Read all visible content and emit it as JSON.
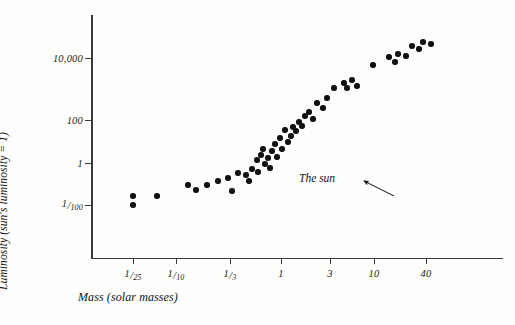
{
  "figure": {
    "kind": "scatter-plot",
    "background_color": "#fdfdfb",
    "ink_color": "#111110"
  },
  "axes": {
    "y_title": "Luminosity (sun's luminosity = 1)",
    "x_title": "Mass (solar masses)",
    "y_ticks": [
      {
        "label": "10,000",
        "num": "",
        "slash": "",
        "den": "",
        "py": 58
      },
      {
        "label": "100",
        "num": "",
        "slash": "",
        "den": "",
        "py": 120
      },
      {
        "label": "1",
        "num": "",
        "slash": "",
        "den": "",
        "py": 163
      },
      {
        "label": "",
        "num": "1",
        "slash": "/",
        "den": "100",
        "py": 205
      }
    ],
    "x_ticks": [
      {
        "label": "",
        "num": "1",
        "slash": "/",
        "den": "25",
        "px": 133
      },
      {
        "label": "",
        "num": "1",
        "slash": "/",
        "den": "10",
        "px": 176
      },
      {
        "label": "",
        "num": "1",
        "slash": "/",
        "den": "3",
        "px": 230
      },
      {
        "label": "1",
        "num": "",
        "slash": "",
        "den": "",
        "px": 281
      },
      {
        "label": "3",
        "num": "",
        "slash": "",
        "den": "",
        "px": 330
      },
      {
        "label": "10",
        "num": "",
        "slash": "",
        "den": "",
        "px": 374
      },
      {
        "label": "40",
        "num": "",
        "slash": "",
        "den": "",
        "px": 426
      }
    ]
  },
  "annotation": {
    "text": "The sun",
    "arrow_from_px": 304,
    "arrow_from_py": 180,
    "arrow_to_px": 272,
    "arrow_to_py": 166
  },
  "chart_data": {
    "type": "scatter",
    "title": "",
    "xlabel": "Mass (solar masses)",
    "ylabel": "Luminosity (sun's luminosity = 1)",
    "xscale": "log",
    "yscale": "log",
    "xtick_values": [
      0.04,
      0.1,
      0.333,
      1,
      3,
      10,
      40
    ],
    "xtick_labels": [
      "1/25",
      "1/10",
      "1/3",
      "1",
      "3",
      "10",
      "40"
    ],
    "ytick_values": [
      10000,
      100,
      1,
      0.01
    ],
    "ytick_labels": [
      "10,000",
      "100",
      "1",
      "1/100"
    ],
    "xlim": [
      0.028,
      60
    ],
    "ylim": [
      0.0015,
      60000
    ],
    "grid": false,
    "legend": false,
    "annotations": [
      {
        "text": "The sun",
        "x": 1.0,
        "y": 1.0
      }
    ],
    "points": [
      {
        "px": 133,
        "py": 196,
        "x": 0.04,
        "y": 0.02
      },
      {
        "px": 133,
        "py": 205,
        "x": 0.04,
        "y": 0.01
      },
      {
        "px": 157,
        "py": 196,
        "x": 0.062,
        "y": 0.02
      },
      {
        "px": 188,
        "py": 185,
        "x": 0.13,
        "y": 0.045
      },
      {
        "px": 196,
        "py": 190,
        "x": 0.155,
        "y": 0.03
      },
      {
        "px": 207,
        "py": 185,
        "x": 0.19,
        "y": 0.045
      },
      {
        "px": 218,
        "py": 181,
        "x": 0.24,
        "y": 0.065
      },
      {
        "px": 228,
        "py": 178,
        "x": 0.3,
        "y": 0.085
      },
      {
        "px": 232,
        "py": 191,
        "x": 0.33,
        "y": 0.028
      },
      {
        "px": 238,
        "py": 173,
        "x": 0.38,
        "y": 0.13
      },
      {
        "px": 246,
        "py": 175,
        "x": 0.47,
        "y": 0.11
      },
      {
        "px": 249,
        "py": 181,
        "x": 0.5,
        "y": 0.065
      },
      {
        "px": 252,
        "py": 169,
        "x": 0.55,
        "y": 0.17
      },
      {
        "px": 257,
        "py": 160,
        "x": 0.62,
        "y": 0.32
      },
      {
        "px": 258,
        "py": 172,
        "x": 0.63,
        "y": 0.14
      },
      {
        "px": 261,
        "py": 155,
        "x": 0.68,
        "y": 0.45
      },
      {
        "px": 263,
        "py": 149,
        "x": 0.72,
        "y": 0.7
      },
      {
        "px": 265,
        "py": 164,
        "x": 0.75,
        "y": 0.25
      },
      {
        "px": 268,
        "py": 158,
        "x": 0.8,
        "y": 0.37
      },
      {
        "px": 270,
        "py": 168,
        "x": 0.85,
        "y": 0.2
      },
      {
        "px": 272,
        "py": 151,
        "x": 0.9,
        "y": 0.6
      },
      {
        "px": 275,
        "py": 144,
        "x": 0.95,
        "y": 1.0
      },
      {
        "px": 277,
        "py": 157,
        "x": 1.0,
        "y": 0.4
      },
      {
        "px": 280,
        "py": 138,
        "x": 1.05,
        "y": 1.6
      },
      {
        "px": 282,
        "py": 149,
        "x": 1.12,
        "y": 0.7
      },
      {
        "px": 285,
        "py": 130,
        "x": 1.2,
        "y": 3.0
      },
      {
        "px": 288,
        "py": 142,
        "x": 1.3,
        "y": 1.2
      },
      {
        "px": 291,
        "py": 136,
        "x": 1.4,
        "y": 1.9
      },
      {
        "px": 293,
        "py": 127,
        "x": 1.45,
        "y": 3.8
      },
      {
        "px": 296,
        "py": 131,
        "x": 1.55,
        "y": 2.8
      },
      {
        "px": 299,
        "py": 122,
        "x": 1.65,
        "y": 5.5
      },
      {
        "px": 302,
        "py": 126,
        "x": 1.75,
        "y": 4.2
      },
      {
        "px": 305,
        "py": 116,
        "x": 1.9,
        "y": 9.0
      },
      {
        "px": 309,
        "py": 112,
        "x": 2.05,
        "y": 13.0
      },
      {
        "px": 313,
        "py": 119,
        "x": 2.2,
        "y": 7.0
      },
      {
        "px": 317,
        "py": 103,
        "x": 2.4,
        "y": 28.0
      },
      {
        "px": 323,
        "py": 108,
        "x": 2.7,
        "y": 18.0
      },
      {
        "px": 327,
        "py": 98,
        "x": 2.9,
        "y": 42.0
      },
      {
        "px": 334,
        "py": 88,
        "x": 3.3,
        "y": 95.0
      },
      {
        "px": 344,
        "py": 83,
        "x": 4.0,
        "y": 150.0
      },
      {
        "px": 347,
        "py": 88,
        "x": 4.2,
        "y": 95.0
      },
      {
        "px": 352,
        "py": 80,
        "x": 4.6,
        "y": 200.0
      },
      {
        "px": 357,
        "py": 86,
        "x": 5.0,
        "y": 115.0
      },
      {
        "px": 373,
        "py": 65,
        "x": 10.0,
        "y": 800.0
      },
      {
        "px": 389,
        "py": 57,
        "x": 14.0,
        "y": 1700.0
      },
      {
        "px": 395,
        "py": 62,
        "x": 16.0,
        "y": 1100.0
      },
      {
        "px": 398,
        "py": 54,
        "x": 17.5,
        "y": 2200.0
      },
      {
        "px": 406,
        "py": 56,
        "x": 21.0,
        "y": 1900.0
      },
      {
        "px": 412,
        "py": 46,
        "x": 24.0,
        "y": 4200.0
      },
      {
        "px": 419,
        "py": 49,
        "x": 28.0,
        "y": 3400.0
      },
      {
        "px": 423,
        "py": 42,
        "x": 31.0,
        "y": 6000.0
      },
      {
        "px": 431,
        "py": 44,
        "x": 36.0,
        "y": 5200.0
      }
    ]
  }
}
